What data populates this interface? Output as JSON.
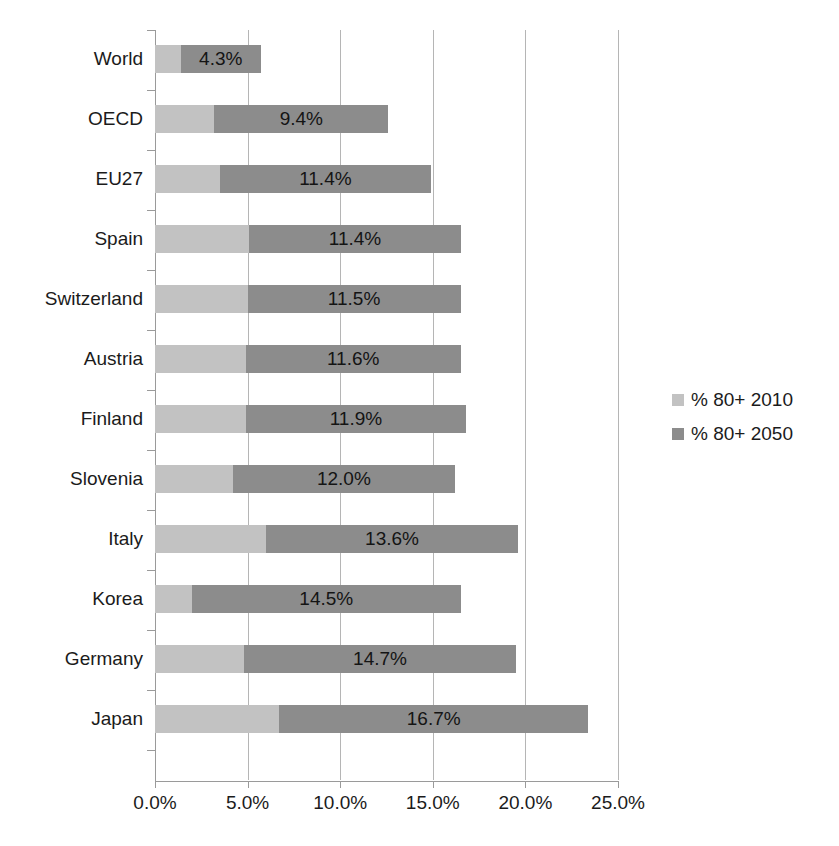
{
  "chart_data": {
    "type": "bar",
    "orientation": "horizontal",
    "stacked": true,
    "title": "",
    "xlabel": "",
    "ylabel": "",
    "xlim": [
      0,
      25
    ],
    "grid": true,
    "legend_position": "right",
    "x_tick_labels": [
      "0.0%",
      "5.0%",
      "10.0%",
      "15.0%",
      "20.0%",
      "25.0%"
    ],
    "x_tick_values": [
      0,
      5,
      10,
      15,
      20,
      25
    ],
    "categories": [
      "World",
      "OECD",
      "EU27",
      "Spain",
      "Switzerland",
      "Austria",
      "Finland",
      "Slovenia",
      "Italy",
      "Korea",
      "Germany",
      "Japan"
    ],
    "series": [
      {
        "name": "% 80+ 2010",
        "color": "#c2c2c2",
        "values": [
          1.4,
          3.2,
          3.5,
          5.1,
          5.0,
          4.9,
          4.9,
          4.2,
          6.0,
          2.0,
          4.8,
          6.7
        ],
        "labels_shown": false
      },
      {
        "name": "% 80+ 2050",
        "color": "#8c8c8c",
        "values": [
          4.3,
          9.4,
          11.4,
          11.4,
          11.5,
          11.6,
          11.9,
          12.0,
          13.6,
          14.5,
          14.7,
          16.7
        ],
        "labels_shown": true,
        "value_labels": [
          "4.3%",
          "9.4%",
          "11.4%",
          "11.4%",
          "11.5%",
          "11.6%",
          "11.9%",
          "12.0%",
          "13.6%",
          "14.5%",
          "14.7%",
          "16.7%"
        ]
      }
    ],
    "totals": [
      5.7,
      12.6,
      14.9,
      16.5,
      16.5,
      16.5,
      16.8,
      16.2,
      19.6,
      16.5,
      19.5,
      23.4
    ]
  },
  "legend": {
    "items": [
      {
        "label": "% 80+ 2010",
        "color": "#c2c2c2"
      },
      {
        "label": "% 80+ 2050",
        "color": "#8c8c8c"
      }
    ]
  },
  "axis": {
    "tick_labels": [
      "0.0%",
      "5.0%",
      "10.0%",
      "15.0%",
      "20.0%",
      "25.0%"
    ]
  }
}
